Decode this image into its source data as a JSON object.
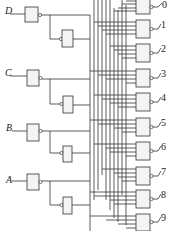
{
  "diagram": {
    "type": "BCD-to-decimal decoder logic circuit",
    "inputs": [
      {
        "label": "D",
        "y": 12
      },
      {
        "label": "C",
        "y": 73
      },
      {
        "label": "B",
        "y": 134
      },
      {
        "label": "A",
        "y": 180
      }
    ],
    "outputs": [
      {
        "label": "0",
        "y": 6
      },
      {
        "label": "1",
        "y": 27
      },
      {
        "label": "2",
        "y": 50
      },
      {
        "label": "3",
        "y": 76
      },
      {
        "label": "4",
        "y": 99
      },
      {
        "label": "5",
        "y": 124
      },
      {
        "label": "6",
        "y": 148
      },
      {
        "label": "7",
        "y": 173
      },
      {
        "label": "8",
        "y": 196
      },
      {
        "label": "9",
        "y": 220
      }
    ]
  }
}
